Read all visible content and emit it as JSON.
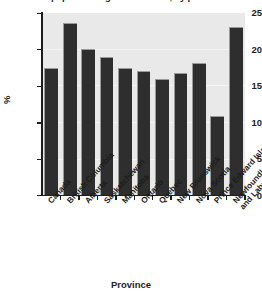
{
  "chart_data": {
    "type": "bar",
    "title": "Percent of population aged 12 or older, by province",
    "xlabel": "Province",
    "ylabel": "%",
    "ylim": [
      0,
      25
    ],
    "yticks": [
      0,
      5,
      10,
      15,
      20,
      25
    ],
    "grid": true,
    "legend": "none",
    "categories": [
      "Canada",
      "British Columbia",
      "Alberta",
      "Saskatchewan",
      "Manitoba",
      "Ontario",
      "Québec",
      "New Brunswick",
      "Nova Scotia",
      "Prince Edward Island",
      "Newfoundland and Labrador"
    ],
    "values": [
      17.5,
      23.6,
      20.1,
      19.0,
      17.5,
      17.1,
      16.0,
      16.7,
      18.2,
      10.9,
      23.1
    ],
    "bar_color": "#2e2e2e",
    "plot_background": "#e9e9e9"
  },
  "axis": {
    "y_tick_labels": [
      "25",
      "20",
      "15",
      "10",
      "5",
      "0"
    ],
    "y_axis_label": "%",
    "x_axis_title": "Province"
  }
}
